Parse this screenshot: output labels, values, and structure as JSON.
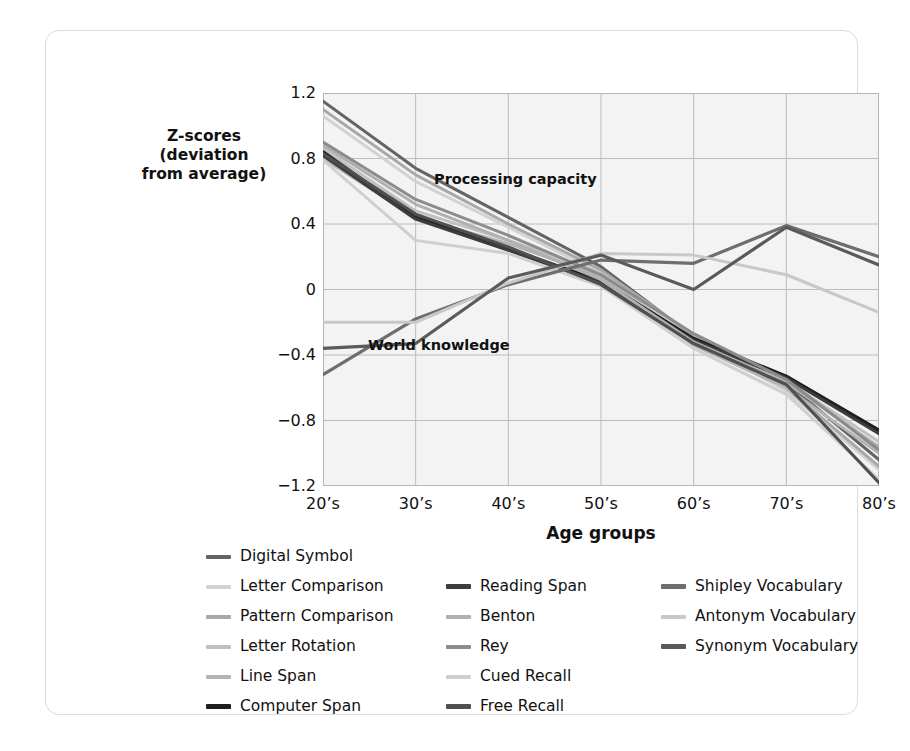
{
  "chart_data": {
    "type": "line",
    "title": "",
    "xlabel": "Age groups",
    "ylabel": "Z-scores\n(deviation\nfrom average)",
    "categories": [
      "20's",
      "30's",
      "40's",
      "50's",
      "60's",
      "70's",
      "80's"
    ],
    "ylim": [
      -1.2,
      1.2
    ],
    "yticks": [
      "1.2",
      "0.8",
      "0.4",
      "0",
      "-0.4",
      "-0.8",
      "-1.2"
    ],
    "ytick_values": [
      1.2,
      0.8,
      0.4,
      0,
      -0.4,
      -0.8,
      -1.2
    ],
    "grid": true,
    "legend_position": "below-plot",
    "annotations": [
      {
        "text": "Processing capacity",
        "x": "40's-50's",
        "y": 0.68
      },
      {
        "text": "World knowledge",
        "x": "30's-40's",
        "y": -0.38
      }
    ],
    "series": [
      {
        "name": "Digital Symbol",
        "color": "#646464",
        "width": 3.0,
        "values": [
          1.15,
          0.74,
          0.44,
          0.14,
          -0.29,
          -0.57,
          -1.04
        ]
      },
      {
        "name": "Letter Comparison",
        "color": "#d2d2d2",
        "width": 3.0,
        "values": [
          1.06,
          0.66,
          0.38,
          0.1,
          -0.3,
          -0.62,
          -1.1
        ]
      },
      {
        "name": "Pattern Comparison",
        "color": "#a8a8a8",
        "width": 3.0,
        "values": [
          1.1,
          0.7,
          0.4,
          0.12,
          -0.28,
          -0.6,
          -1.08
        ]
      },
      {
        "name": "Letter Rotation",
        "color": "#c0c0c0",
        "width": 3.0,
        "values": [
          0.86,
          0.48,
          0.3,
          0.1,
          -0.33,
          -0.56,
          -0.93
        ]
      },
      {
        "name": "Line Span",
        "color": "#b4b4b4",
        "width": 3.0,
        "values": [
          0.8,
          0.44,
          0.28,
          0.08,
          -0.34,
          -0.6,
          -1.0
        ]
      },
      {
        "name": "Computer Span",
        "color": "#1e1e1e",
        "width": 3.4,
        "values": [
          0.84,
          0.44,
          0.25,
          0.05,
          -0.3,
          -0.53,
          -0.86
        ]
      },
      {
        "name": "Reading Span",
        "color": "#3c3c3c",
        "width": 3.2,
        "values": [
          0.82,
          0.43,
          0.24,
          0.04,
          -0.31,
          -0.54,
          -0.88
        ]
      },
      {
        "name": "Benton",
        "color": "#b0b0b0",
        "width": 3.0,
        "values": [
          0.88,
          0.52,
          0.3,
          0.06,
          -0.32,
          -0.57,
          -0.96
        ]
      },
      {
        "name": "Rey",
        "color": "#8c8c8c",
        "width": 3.0,
        "values": [
          0.9,
          0.55,
          0.33,
          0.09,
          -0.27,
          -0.55,
          -0.98
        ]
      },
      {
        "name": "Cued Recall",
        "color": "#cfcfcf",
        "width": 3.0,
        "values": [
          0.79,
          0.3,
          0.22,
          0.02,
          -0.36,
          -0.64,
          -1.16
        ]
      },
      {
        "name": "Free Recall",
        "color": "#505050",
        "width": 3.2,
        "values": [
          0.83,
          0.46,
          0.26,
          0.03,
          -0.33,
          -0.58,
          -1.18
        ]
      },
      {
        "name": "Shipley Vocabulary",
        "color": "#6e6e6e",
        "width": 3.2,
        "values": [
          -0.52,
          -0.18,
          0.03,
          0.18,
          0.16,
          0.39,
          0.2
        ]
      },
      {
        "name": "Antonym Vocabulary",
        "color": "#c8c8c8",
        "width": 3.0,
        "values": [
          -0.2,
          -0.2,
          0.04,
          0.22,
          0.21,
          0.09,
          -0.14
        ]
      },
      {
        "name": "Synonym Vocabulary",
        "color": "#5a5a5a",
        "width": 3.2,
        "values": [
          -0.36,
          -0.33,
          0.07,
          0.21,
          0.0,
          0.38,
          0.15
        ]
      }
    ]
  },
  "axis": {
    "y_title": "Z-scores\n(deviation\nfrom average)",
    "x_title": "Age groups"
  },
  "annotations": {
    "processing": "Processing capacity",
    "world": "World knowledge"
  },
  "legend": {
    "columns": [
      [
        {
          "label": "Digital Symbol",
          "color": "#646464",
          "thickness": 4
        },
        {
          "label": "Letter Comparison",
          "color": "#d2d2d2",
          "thickness": 4
        },
        {
          "label": "Pattern Comparison",
          "color": "#a8a8a8",
          "thickness": 4
        },
        {
          "label": "Letter Rotation",
          "color": "#c0c0c0",
          "thickness": 4
        },
        {
          "label": "Line Span",
          "color": "#b4b4b4",
          "thickness": 4
        },
        {
          "label": "Computer Span",
          "color": "#1e1e1e",
          "thickness": 5
        }
      ],
      [
        {
          "label": "Reading Span",
          "color": "#3c3c3c",
          "thickness": 5
        },
        {
          "label": "Benton",
          "color": "#b0b0b0",
          "thickness": 4
        },
        {
          "label": "Rey",
          "color": "#8c8c8c",
          "thickness": 4
        },
        {
          "label": "Cued Recall",
          "color": "#cfcfcf",
          "thickness": 4
        },
        {
          "label": "Free Recall",
          "color": "#505050",
          "thickness": 5
        }
      ],
      [
        {
          "label": "Shipley Vocabulary",
          "color": "#6e6e6e",
          "thickness": 5
        },
        {
          "label": "Antonym Vocabulary",
          "color": "#c8c8c8",
          "thickness": 4
        },
        {
          "label": "Synonym Vocabulary",
          "color": "#5a5a5a",
          "thickness": 5
        }
      ]
    ]
  },
  "style": {
    "plot_background": "#f3f3f3",
    "grid_color": "#bcbcbc",
    "frame_color": "#b6b6b6",
    "card_border": "#dcdcdc",
    "text_color": "#111111"
  }
}
